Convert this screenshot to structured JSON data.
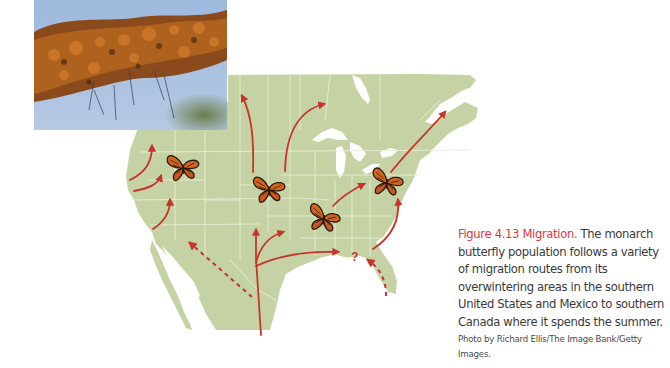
{
  "colors": {
    "land": "#c5d3a4",
    "border": "#e6ecd6",
    "water": "#ffffff",
    "route": "#c8342a",
    "figure_label": "#e0383d",
    "caption_text": "#3a3a3a",
    "butterfly_orange": "#d4631e",
    "butterfly_black": "#2b1a10"
  },
  "photo": {
    "subject": "monarch butterflies clustered on tree branch",
    "sky_color": "#a4bfdf"
  },
  "map": {
    "region": "North America (United States, southern Canada, Mexico)",
    "butterflies": [
      {
        "name": "butterfly-west",
        "x": 183,
        "y": 167
      },
      {
        "name": "butterfly-north-central",
        "x": 269,
        "y": 189
      },
      {
        "name": "butterfly-south-central",
        "x": 324,
        "y": 218
      },
      {
        "name": "butterfly-east",
        "x": 387,
        "y": 182
      }
    ],
    "question_mark": "?",
    "routes_count": 13
  },
  "caption": {
    "figure_label": "Figure 4.13  Migration.",
    "body": " The monarch butterfly population follows a variety of migration routes from its overwintering areas in the southern United States and Mexico to southern Canada where it spends the summer.",
    "credit": "Photo by Richard Ellis/The Image Bank/Getty Images."
  }
}
